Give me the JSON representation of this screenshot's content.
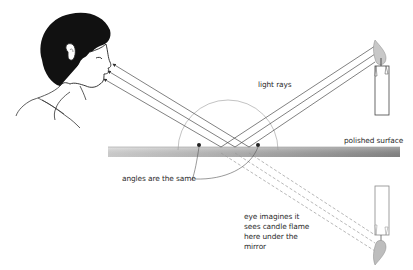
{
  "diagram": {
    "labels": {
      "light_rays": "light rays",
      "polished_surface": "polished surface",
      "angles_same": "angles are the same",
      "eye_imagines": "eye imagines it\nsees candle flame\nhere under the\nmirror"
    },
    "colors": {
      "ray_line": "#4a4a4a",
      "mirror_light": "#d8d8d8",
      "mirror_dark": "#8c8c8c",
      "hair": "#111111",
      "text": "#2a2a2a"
    }
  }
}
